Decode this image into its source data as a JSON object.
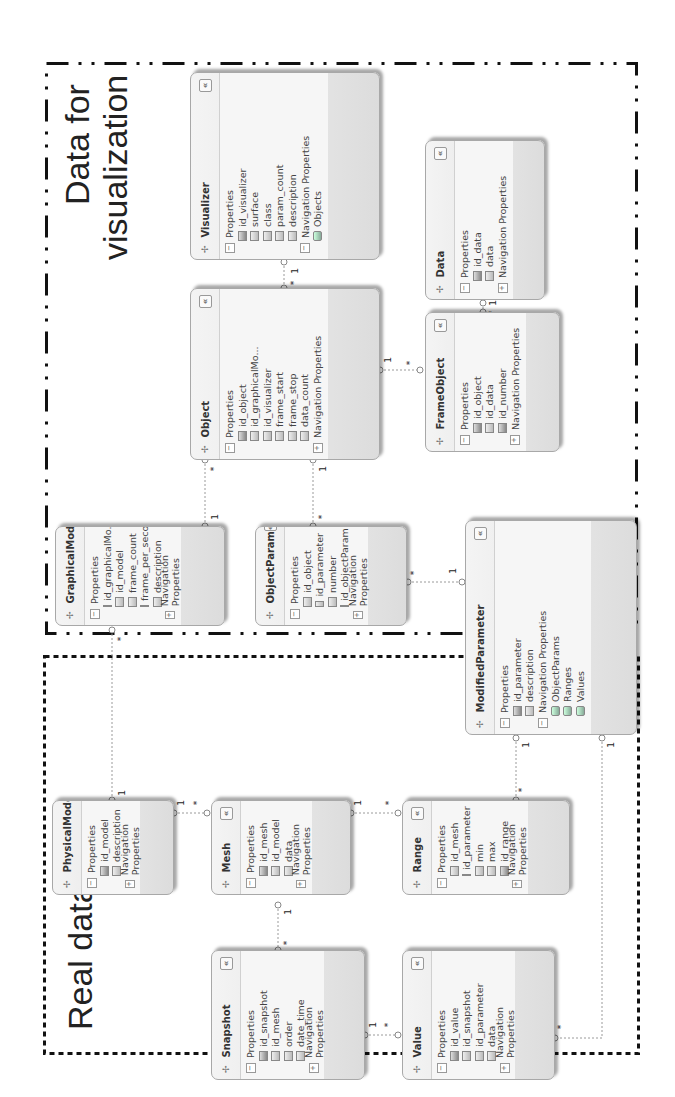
{
  "regions": {
    "visualization": {
      "label_line1": "Data for",
      "label_line2": "visualization",
      "border_style": "dash-dot"
    },
    "real": {
      "label": "Real data",
      "border_style": "dotted"
    }
  },
  "labels": {
    "properties": "Properties",
    "navigation": "Navigation Properties",
    "collapse": "«"
  },
  "entities": {
    "visualizer": {
      "name": "Visualizer",
      "props": [
        "id_visualizer",
        "surface",
        "class",
        "param_count",
        "description"
      ],
      "keys": [
        0
      ],
      "nav": [
        "Objects"
      ]
    },
    "data": {
      "name": "Data",
      "props": [
        "id_data",
        "data"
      ],
      "keys": [
        0
      ],
      "nav": []
    },
    "object": {
      "name": "Object",
      "props": [
        "id_object",
        "id_graphicalMo...",
        "id_visualizer",
        "frame_start",
        "frame_stop",
        "data_count"
      ],
      "keys": [
        0
      ],
      "nav": []
    },
    "frameobject": {
      "name": "FrameObject",
      "props": [
        "id_object",
        "id_data",
        "id_number"
      ],
      "keys": [
        0,
        2
      ],
      "nav": []
    },
    "graphicalmodel": {
      "name": "GraphicalModel",
      "props": [
        "id_graphicalMo...",
        "id_model",
        "frame_count",
        "frame_per_second",
        "description"
      ],
      "keys": [
        0
      ],
      "nav": []
    },
    "objectparam": {
      "name": "ObjectParam",
      "props": [
        "id_object",
        "id_parameter",
        "number",
        "id_objectParam"
      ],
      "keys": [
        3
      ],
      "nav": []
    },
    "modifiedparameter": {
      "name": "ModifiedParameter",
      "props": [
        "id_parameter",
        "description"
      ],
      "keys": [
        0
      ],
      "nav": [
        "ObjectParams",
        "Ranges",
        "Values"
      ]
    },
    "physicalmodel": {
      "name": "PhysicalModel",
      "props": [
        "id_model",
        "description"
      ],
      "keys": [
        0
      ],
      "nav": []
    },
    "mesh": {
      "name": "Mesh",
      "props": [
        "id_mesh",
        "id_model",
        "data"
      ],
      "keys": [
        0
      ],
      "nav": []
    },
    "range": {
      "name": "Range",
      "props": [
        "id_mesh",
        "id_parameter",
        "min",
        "max",
        "id_range"
      ],
      "keys": [
        4
      ],
      "nav": []
    },
    "snapshot": {
      "name": "Snapshot",
      "props": [
        "id_snapshot",
        "id_mesh",
        "order",
        "date_time"
      ],
      "keys": [
        0
      ],
      "nav": []
    },
    "value": {
      "name": "Value",
      "props": [
        "id_value",
        "id_snapshot",
        "id_parameter",
        "data"
      ],
      "keys": [
        0
      ],
      "nav": []
    }
  },
  "relationships": [
    {
      "from": "Visualizer",
      "to": "Object",
      "from_mult": "1",
      "to_mult": "*"
    },
    {
      "from": "Data",
      "to": "FrameObject",
      "from_mult": "1",
      "to_mult": "*"
    },
    {
      "from": "Object",
      "to": "FrameObject",
      "from_mult": "1",
      "to_mult": "*"
    },
    {
      "from": "GraphicalModel",
      "to": "Object",
      "from_mult": "1",
      "to_mult": "*"
    },
    {
      "from": "Object",
      "to": "ObjectParam",
      "from_mult": "1",
      "to_mult": "*"
    },
    {
      "from": "ModifiedParameter",
      "to": "ObjectParam",
      "from_mult": "1",
      "to_mult": "*"
    },
    {
      "from": "PhysicalModel",
      "to": "GraphicalModel",
      "from_mult": "1",
      "to_mult": "*"
    },
    {
      "from": "PhysicalModel",
      "to": "Mesh",
      "from_mult": "1",
      "to_mult": "*"
    },
    {
      "from": "Mesh",
      "to": "Range",
      "from_mult": "1",
      "to_mult": "*"
    },
    {
      "from": "Mesh",
      "to": "Snapshot",
      "from_mult": "1",
      "to_mult": "*"
    },
    {
      "from": "ModifiedParameter",
      "to": "Range",
      "from_mult": "1",
      "to_mult": "*"
    },
    {
      "from": "Snapshot",
      "to": "Value",
      "from_mult": "1",
      "to_mult": "*"
    },
    {
      "from": "ModifiedParameter",
      "to": "Value",
      "from_mult": "1",
      "to_mult": "*"
    }
  ],
  "multiplicity": {
    "one": "1",
    "many": "*"
  }
}
